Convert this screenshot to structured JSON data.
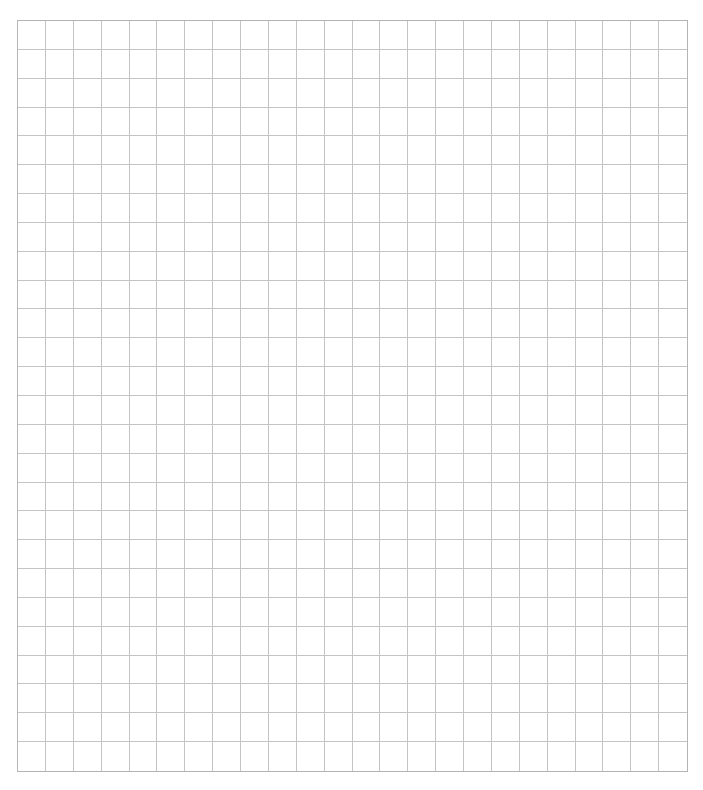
{
  "grid": {
    "columns": 24,
    "rows": 26,
    "line_color": "#c4c4c4",
    "border_color": "#b4b4b4",
    "background": "#ffffff"
  }
}
